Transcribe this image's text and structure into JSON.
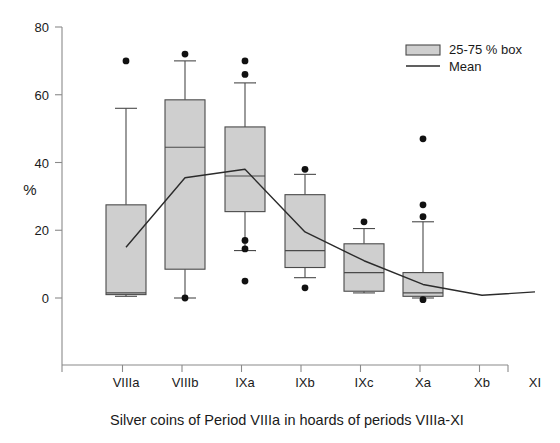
{
  "chart_data": {
    "type": "box",
    "title": "",
    "caption": "Silver coins of Period VIIIa in hoards of periods VIIIa-XI",
    "xlabel": "",
    "ylabel": "%",
    "ylim": [
      0,
      80
    ],
    "yticks": [
      0,
      20,
      40,
      60,
      80
    ],
    "ytick_labels": [
      "0",
      "20",
      "40",
      "60",
      "80"
    ],
    "grid": false,
    "categories": [
      "VIIIa",
      "VIIIb",
      "IXa",
      "IXb",
      "IXc",
      "Xa",
      "Xb",
      "XI"
    ],
    "legend": {
      "position": "top-right",
      "entries": [
        {
          "label": "25-75 % box",
          "marker": "filled-box",
          "color": "#cfcfcf"
        },
        {
          "label": "Mean",
          "marker": "line",
          "color": "#2b2b2b"
        }
      ]
    },
    "boxes": [
      {
        "category": "VIIIa",
        "q1": 1.0,
        "median": 1.5,
        "q3": 27.5,
        "whisker_low": 0.5,
        "whisker_high": 56.0,
        "mean": 15.0,
        "outliers": [
          70.0
        ]
      },
      {
        "category": "VIIIb",
        "q1": 8.5,
        "median": 44.5,
        "q3": 58.5,
        "whisker_low": 0.0,
        "whisker_high": 70.0,
        "mean": 35.5,
        "outliers": [
          72.0,
          0.0
        ]
      },
      {
        "category": "IXa",
        "q1": 25.5,
        "median": 36.0,
        "q3": 50.5,
        "whisker_low": 14.0,
        "whisker_high": 63.5,
        "mean": 38.0,
        "outliers": [
          70.0,
          66.0,
          17.0,
          14.5,
          5.0
        ]
      },
      {
        "category": "IXb",
        "q1": 9.0,
        "median": 14.0,
        "q3": 30.5,
        "whisker_low": 6.0,
        "whisker_high": 36.5,
        "mean": 19.5,
        "outliers": [
          38.0,
          3.0
        ]
      },
      {
        "category": "IXc",
        "q1": 2.0,
        "median": 7.5,
        "q3": 16.0,
        "whisker_low": 1.5,
        "whisker_high": 20.5,
        "mean": 11.0,
        "outliers": [
          22.5
        ]
      },
      {
        "category": "Xa",
        "q1": 0.5,
        "median": 1.5,
        "q3": 7.5,
        "whisker_low": 0.0,
        "whisker_high": 22.5,
        "mean": 4.0,
        "outliers": [
          47.0,
          27.5,
          24.0,
          -0.5
        ]
      },
      {
        "category": "Xb",
        "q1": null,
        "median": null,
        "q3": null,
        "whisker_low": null,
        "whisker_high": null,
        "mean": 0.8,
        "outliers": []
      },
      {
        "category": "XI",
        "q1": null,
        "median": null,
        "q3": null,
        "whisker_low": null,
        "whisker_high": null,
        "mean": 1.8,
        "outliers": []
      }
    ],
    "mean_series": {
      "name": "Mean",
      "x": [
        "VIIIa",
        "VIIIb",
        "IXa",
        "IXb",
        "IXc",
        "Xa",
        "Xb",
        "XI"
      ],
      "values": [
        15.0,
        35.5,
        38.0,
        19.5,
        11.0,
        4.0,
        0.8,
        1.8
      ]
    }
  }
}
